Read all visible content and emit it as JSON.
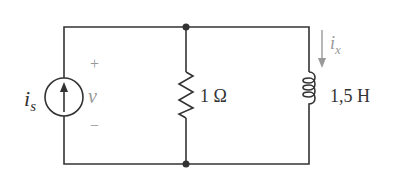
{
  "source": {
    "label_main": "i",
    "label_sub": "s"
  },
  "voltage": {
    "plus": "+",
    "label": "v",
    "minus": "−"
  },
  "resistor": {
    "label": "1 Ω"
  },
  "inductor": {
    "label": "1,5 H"
  },
  "current": {
    "label_main": "i",
    "label_sub": "x"
  },
  "colors": {
    "wire": "#333333",
    "annotation": "#999999"
  }
}
